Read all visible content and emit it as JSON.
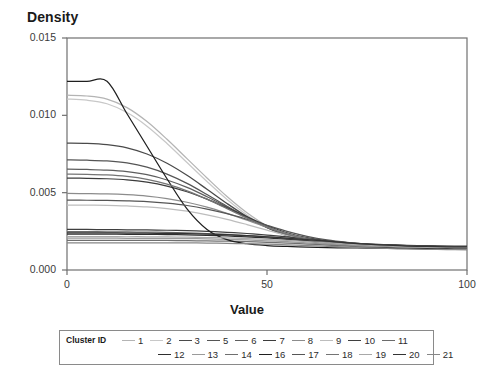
{
  "chart_data": {
    "type": "line",
    "title": "Density",
    "xlabel": "Value",
    "ylabel": "Density",
    "xlim": [
      0,
      100
    ],
    "ylim": [
      0.0,
      0.015
    ],
    "grid": false,
    "legend_position": "bottom",
    "legend_title": "Cluster ID",
    "xticks": [
      "0",
      "50",
      "100"
    ],
    "xtick_values": [
      0,
      50,
      100
    ],
    "yticks": [
      "0.000",
      "0.005",
      "0.010",
      "0.015"
    ],
    "ytick_values": [
      0.0,
      0.005,
      0.01,
      0.015
    ],
    "x": [
      0,
      5,
      10,
      15,
      20,
      25,
      30,
      35,
      40,
      45,
      50,
      55,
      60,
      65,
      70,
      75,
      80,
      85,
      90,
      95,
      100
    ],
    "series": [
      {
        "name": "1",
        "color": "#b4b4b4",
        "values": [
          0.0113,
          0.01125,
          0.01105,
          0.0105,
          0.0096,
          0.00845,
          0.0072,
          0.00595,
          0.00475,
          0.0037,
          0.00285,
          0.00225,
          0.0019,
          0.00172,
          0.00162,
          0.00156,
          0.00152,
          0.0015,
          0.00148,
          0.00147,
          0.00146
        ]
      },
      {
        "name": "2",
        "color": "#c8c8c8",
        "values": [
          0.01105,
          0.01098,
          0.01075,
          0.01018,
          0.0093,
          0.00818,
          0.00695,
          0.00572,
          0.00456,
          0.00356,
          0.00275,
          0.00218,
          0.00185,
          0.00168,
          0.00159,
          0.00153,
          0.0015,
          0.00148,
          0.00146,
          0.00145,
          0.00144
        ]
      },
      {
        "name": "3",
        "color": "#4a4a4a",
        "values": [
          0.0082,
          0.00818,
          0.0081,
          0.0079,
          0.0075,
          0.0069,
          0.00612,
          0.00522,
          0.0043,
          0.00345,
          0.00275,
          0.00222,
          0.0019,
          0.00172,
          0.00162,
          0.00156,
          0.00152,
          0.0015,
          0.00148,
          0.00147,
          0.00146
        ]
      },
      {
        "name": "5",
        "color": "#555555",
        "values": [
          0.00712,
          0.0071,
          0.00705,
          0.00692,
          0.00665,
          0.0062,
          0.0056,
          0.00488,
          0.00412,
          0.00338,
          0.00274,
          0.00224,
          0.00193,
          0.00175,
          0.00164,
          0.00158,
          0.00154,
          0.00151,
          0.00149,
          0.00148,
          0.00147
        ]
      },
      {
        "name": "6",
        "color": "#5e5e5e",
        "values": [
          0.00652,
          0.0065,
          0.00646,
          0.00636,
          0.00616,
          0.00582,
          0.00534,
          0.00474,
          0.00408,
          0.00341,
          0.0028,
          0.00231,
          0.00199,
          0.0018,
          0.00169,
          0.00162,
          0.00157,
          0.00154,
          0.00152,
          0.0015,
          0.00149
        ]
      },
      {
        "name": "7",
        "color": "#3c3c3c",
        "values": [
          0.00594,
          0.00593,
          0.0059,
          0.00583,
          0.00568,
          0.00543,
          0.00506,
          0.00458,
          0.00402,
          0.00344,
          0.00288,
          0.00241,
          0.00209,
          0.00189,
          0.00177,
          0.00169,
          0.00164,
          0.0016,
          0.00157,
          0.00155,
          0.00154
        ]
      },
      {
        "name": "8",
        "color": "#8c8c8c",
        "values": [
          0.00495,
          0.00494,
          0.00492,
          0.00487,
          0.00478,
          0.00462,
          0.00438,
          0.00406,
          0.00366,
          0.00322,
          0.00277,
          0.00236,
          0.00205,
          0.00184,
          0.00171,
          0.00163,
          0.00158,
          0.00154,
          0.00152,
          0.0015,
          0.00149
        ]
      },
      {
        "name": "9",
        "color": "#bdbdbd",
        "values": [
          0.0042,
          0.00419,
          0.00418,
          0.00414,
          0.00408,
          0.00397,
          0.0038,
          0.00357,
          0.00328,
          0.00294,
          0.00258,
          0.00223,
          0.00195,
          0.00175,
          0.00162,
          0.00154,
          0.00148,
          0.00145,
          0.00142,
          0.00141,
          0.0014
        ]
      },
      {
        "name": "10",
        "color": "#3f3f3f",
        "values": [
          0.00262,
          0.00262,
          0.00261,
          0.0026,
          0.00259,
          0.00257,
          0.00254,
          0.0025,
          0.00244,
          0.00236,
          0.00226,
          0.00214,
          0.00201,
          0.00188,
          0.00177,
          0.00168,
          0.00162,
          0.00157,
          0.00154,
          0.00152,
          0.00151
        ]
      },
      {
        "name": "11",
        "color": "#6b6b6b",
        "values": [
          0.00248,
          0.00248,
          0.00247,
          0.00246,
          0.00245,
          0.00243,
          0.0024,
          0.00236,
          0.0023,
          0.00223,
          0.00214,
          0.00203,
          0.00191,
          0.00179,
          0.00169,
          0.00161,
          0.00155,
          0.00151,
          0.00148,
          0.00146,
          0.00145
        ]
      },
      {
        "name": "12",
        "color": "#2e2e2e",
        "values": [
          0.00232,
          0.00232,
          0.00232,
          0.00231,
          0.0023,
          0.00229,
          0.00227,
          0.00224,
          0.0022,
          0.00214,
          0.00207,
          0.00198,
          0.00188,
          0.00178,
          0.00169,
          0.00161,
          0.00155,
          0.00151,
          0.00148,
          0.00146,
          0.00145
        ]
      },
      {
        "name": "13",
        "color": "#9a9a9a",
        "values": [
          0.00206,
          0.00206,
          0.00206,
          0.00205,
          0.00205,
          0.00204,
          0.00203,
          0.00201,
          0.00198,
          0.00194,
          0.00189,
          0.00183,
          0.00176,
          0.00168,
          0.0016,
          0.00153,
          0.00147,
          0.00143,
          0.0014,
          0.00138,
          0.00137
        ]
      },
      {
        "name": "14",
        "color": "#6f6f6f",
        "values": [
          0.00192,
          0.00192,
          0.00192,
          0.00192,
          0.00191,
          0.00191,
          0.0019,
          0.00188,
          0.00186,
          0.00183,
          0.00179,
          0.00174,
          0.00168,
          0.00161,
          0.00154,
          0.00147,
          0.00142,
          0.00138,
          0.00135,
          0.00133,
          0.00132
        ]
      },
      {
        "name": "16",
        "color": "#1f1f1f",
        "values": [
          0.0122,
          0.0122,
          0.0122,
          0.0101,
          0.008,
          0.0059,
          0.00395,
          0.00262,
          0.00196,
          0.0017,
          0.00158,
          0.00152,
          0.00148,
          0.00145,
          0.00143,
          0.00142,
          0.00141,
          0.0014,
          0.00139,
          0.00139,
          0.00138
        ]
      },
      {
        "name": "17",
        "color": "#565656",
        "values": [
          0.00452,
          0.00451,
          0.0045,
          0.00447,
          0.00442,
          0.00432,
          0.00417,
          0.00394,
          0.00364,
          0.00328,
          0.00289,
          0.0025,
          0.00218,
          0.00194,
          0.00178,
          0.00167,
          0.0016,
          0.00155,
          0.00152,
          0.0015,
          0.00149
        ]
      },
      {
        "name": "18",
        "color": "#747474",
        "values": [
          0.0062,
          0.00619,
          0.00615,
          0.00605,
          0.00586,
          0.00555,
          0.00512,
          0.00458,
          0.00397,
          0.00335,
          0.00278,
          0.00232,
          0.002,
          0.0018,
          0.00168,
          0.00161,
          0.00156,
          0.00152,
          0.0015,
          0.00148,
          0.00147
        ]
      },
      {
        "name": "19",
        "color": "#a8a8a8",
        "values": [
          0.00216,
          0.00216,
          0.00216,
          0.00215,
          0.00215,
          0.00214,
          0.00212,
          0.0021,
          0.00207,
          0.00203,
          0.00198,
          0.00191,
          0.00184,
          0.00176,
          0.00168,
          0.0016,
          0.00154,
          0.00149,
          0.00146,
          0.00144,
          0.00143
        ]
      },
      {
        "name": "20",
        "color": "#333333",
        "values": [
          0.0024,
          0.0024,
          0.0024,
          0.00239,
          0.00238,
          0.00237,
          0.00235,
          0.00232,
          0.00228,
          0.00222,
          0.00215,
          0.00206,
          0.00196,
          0.00186,
          0.00176,
          0.00167,
          0.0016,
          0.00155,
          0.00152,
          0.0015,
          0.00149
        ]
      },
      {
        "name": "21",
        "color": "#878787",
        "values": [
          0.00176,
          0.00176,
          0.00176,
          0.00176,
          0.00176,
          0.00175,
          0.00175,
          0.00174,
          0.00172,
          0.0017,
          0.00167,
          0.00163,
          0.00158,
          0.00153,
          0.00148,
          0.00143,
          0.00139,
          0.00136,
          0.00134,
          0.00132,
          0.00131
        ]
      }
    ]
  },
  "legend": {
    "caption": "Cluster ID",
    "rows": [
      [
        "1",
        "2",
        "3",
        "5",
        "6",
        "7",
        "8",
        "9",
        "10",
        "11"
      ],
      [
        "12",
        "13",
        "14",
        "16",
        "17",
        "18",
        "19",
        "20",
        "21"
      ]
    ]
  },
  "axes": {
    "frame_color": "#707070",
    "tick_color": "#707070",
    "label_color": "#3a3a3a"
  }
}
